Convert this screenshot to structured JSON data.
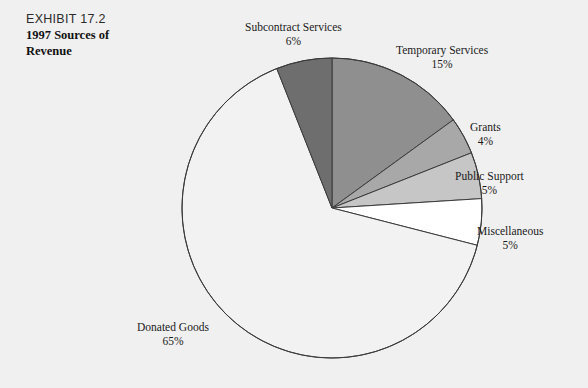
{
  "exhibit": {
    "number_label": "EXHIBIT 17.2",
    "title": "1997 Sources of Revenue"
  },
  "chart_data": {
    "type": "pie",
    "title": "1997 Sources of Revenue",
    "subtitle": "EXHIBIT 17.2",
    "unit": "percent",
    "start_angle_deg": 0,
    "direction": "clockwise",
    "legend": "none-labels-outside",
    "categories": [
      "Temporary Services",
      "Grants",
      "Public Support",
      "Miscellaneous",
      "Donated Goods",
      "Subcontract Services"
    ],
    "values": [
      15,
      4,
      5,
      5,
      65,
      6
    ],
    "colors": [
      "#8f8f8f",
      "#a8a8a8",
      "#c6c6c6",
      "#ffffff",
      "#f2f2f2",
      "#6e6e6e"
    ],
    "slices": [
      {
        "name": "Temporary Services",
        "value": 15,
        "label": "Temporary Services",
        "percent_label": "15%",
        "color": "#8f8f8f"
      },
      {
        "name": "Grants",
        "value": 4,
        "label": "Grants",
        "percent_label": "4%",
        "color": "#a8a8a8"
      },
      {
        "name": "Public Support",
        "value": 5,
        "label": "Public Support",
        "percent_label": "5%",
        "color": "#c6c6c6"
      },
      {
        "name": "Miscellaneous",
        "value": 5,
        "label": "Miscellaneous",
        "percent_label": "5%",
        "color": "#ffffff"
      },
      {
        "name": "Donated Goods",
        "value": 65,
        "label": "Donated Goods",
        "percent_label": "65%",
        "color": "#f2f2f2"
      },
      {
        "name": "Subcontract Services",
        "value": 6,
        "label": "Subcontract Services",
        "percent_label": "6%",
        "color": "#6e6e6e"
      }
    ],
    "geometry": {
      "center_x": 332,
      "center_y": 208,
      "radius": 150
    },
    "stroke_color": "#3b3b3b",
    "background_color": "#f0f0f0"
  }
}
